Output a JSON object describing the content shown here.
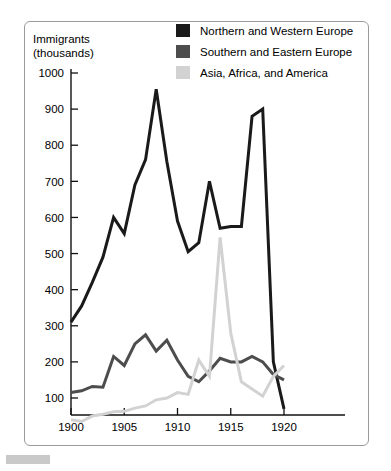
{
  "figure": {
    "axis_title_line1": "Immigrants",
    "axis_title_line2": "(thousands)"
  },
  "legend": {
    "position": "top-right",
    "items": [
      {
        "label": "Northern and Western Europe",
        "color": "#1a1a1a",
        "key": "northern_western_europe"
      },
      {
        "label": "Southern and Eastern Europe",
        "color": "#4d4d4d",
        "key": "southern_eastern_europe"
      },
      {
        "label": "Asia, Africa, and America",
        "color": "#d2d2d2",
        "key": "asia_africa_america"
      }
    ]
  },
  "chart_data": {
    "type": "line",
    "xlabel": "",
    "ylabel": "Immigrants (thousands)",
    "xlim": [
      1899,
      1921
    ],
    "ylim": [
      0,
      1000
    ],
    "xticks": [
      1900,
      1905,
      1910,
      1915,
      1920
    ],
    "yticks": [
      100,
      200,
      300,
      400,
      500,
      600,
      700,
      800,
      900,
      1000
    ],
    "grid": false,
    "x": [
      1900,
      1901,
      1902,
      1903,
      1904,
      1905,
      1906,
      1907,
      1908,
      1909,
      1910,
      1911,
      1912,
      1913,
      1914,
      1915,
      1916,
      1917,
      1918,
      1919,
      1920
    ],
    "series": [
      {
        "name": "Northern and Western Europe",
        "color": "#1a1a1a",
        "values": [
          310,
          355,
          420,
          490,
          600,
          555,
          690,
          760,
          955,
          755,
          590,
          505,
          530,
          700,
          570,
          575,
          575,
          880,
          900,
          200,
          70
        ]
      },
      {
        "name": "Southern and Eastern Europe",
        "color": "#4d4d4d",
        "values": [
          115,
          120,
          132,
          130,
          215,
          190,
          250,
          275,
          230,
          260,
          205,
          160,
          145,
          175,
          210,
          200,
          200,
          215,
          200,
          165,
          150
        ]
      },
      {
        "name": "Asia, Africa, and America",
        "color": "#d2d2d2",
        "values": [
          40,
          35,
          50,
          55,
          62,
          63,
          72,
          78,
          95,
          100,
          115,
          110,
          205,
          160,
          545,
          280,
          145,
          125,
          105,
          160,
          190
        ]
      }
    ]
  }
}
